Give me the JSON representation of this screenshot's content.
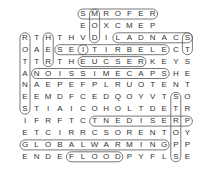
{
  "puzzle": {
    "type": "word-search",
    "grid_origin": {
      "x": 25,
      "y": 14
    },
    "cell_w": 11.6,
    "cell_h": 11.9,
    "rows": [
      "     SMROFER   ",
      "     EOXCMEP   ",
      "RTHTHVDILADNACS",
      "OAESEITIRBELECT",
      "TTRTHEUCSERKEYS",
      "ANOISSIMECAPSHE",
      "NAEPEFPLRUOTENT",
      "EEMDFCEDQOYVTSO",
      "STIAICOHOLTDETR",
      "IFRFTCTNEDISERP",
      "ETCIRRCSORENTOY",
      "GLOBALWARMINGPP",
      "ENDEFLOODPYFLSE"
    ],
    "found_words": [
      {
        "word": "SMROFER",
        "from": [
          0,
          5
        ],
        "to": [
          0,
          11
        ]
      },
      {
        "word": "SCANDAL",
        "from": [
          2,
          14
        ],
        "to": [
          2,
          8
        ]
      },
      {
        "word": "SEI",
        "from": [
          3,
          3
        ],
        "to": [
          3,
          5
        ]
      },
      {
        "word": "ELECTRIC",
        "from": [
          3,
          12
        ],
        "to": [
          3,
          5
        ]
      },
      {
        "word": "EUCSER",
        "from": [
          4,
          5
        ],
        "to": [
          4,
          10
        ]
      },
      {
        "word": "NOISSIMECAPS",
        "from": [
          5,
          1
        ],
        "to": [
          5,
          12
        ]
      },
      {
        "word": "TNEDISERP",
        "from": [
          9,
          6
        ],
        "to": [
          9,
          14
        ]
      },
      {
        "word": "GLOBALWARMING",
        "from": [
          11,
          0
        ],
        "to": [
          11,
          12
        ]
      },
      {
        "word": "FLOOD",
        "from": [
          12,
          4
        ],
        "to": [
          12,
          8
        ]
      },
      {
        "word": "ROTANES",
        "from": [
          2,
          0
        ],
        "to": [
          8,
          0
        ]
      },
      {
        "word": "HER",
        "from": [
          2,
          2
        ],
        "to": [
          4,
          2
        ]
      },
      {
        "word": "MOX",
        "from": [
          0,
          6
        ],
        "to": [
          2,
          6
        ]
      },
      {
        "word": "STOPS",
        "from": [
          7,
          13
        ],
        "to": [
          12,
          13
        ]
      },
      {
        "word": "STEVE",
        "from": [
          2,
          14
        ],
        "to": [
          3,
          14
        ]
      }
    ],
    "outline_color": "#555555",
    "letter_color": "#333333"
  }
}
